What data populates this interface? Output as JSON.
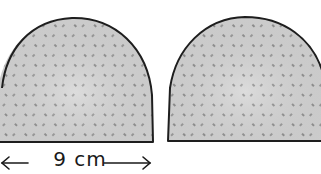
{
  "diagram": {
    "pieces": [
      {
        "name": "left-dome",
        "fill": "#d4d4d4",
        "stroke": "#1e1e1e"
      },
      {
        "name": "right-dome",
        "fill": "#d4d4d4",
        "stroke": "#1e1e1e"
      }
    ],
    "dimension": {
      "value": "9",
      "unit": "cm",
      "text": "9 cm",
      "arrow_left": "←",
      "arrow_right": "→"
    }
  }
}
